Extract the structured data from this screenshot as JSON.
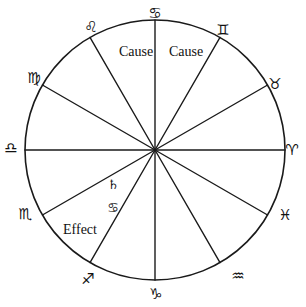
{
  "diagram": {
    "stroke_color": "#1a1a1a",
    "background_color": "#ffffff",
    "center": {
      "x": 155,
      "y": 150
    },
    "radius": 130,
    "spoke_count": 12
  },
  "signs": [
    {
      "name": "cancer",
      "glyph": "♋",
      "label": "Cancer",
      "x": 155,
      "y": 13,
      "angle_deg": 90
    },
    {
      "name": "gemini",
      "glyph": "♊",
      "label": "Gemini",
      "x": 223,
      "y": 30,
      "angle_deg": 60
    },
    {
      "name": "taurus",
      "glyph": "♉",
      "label": "Taurus",
      "x": 275,
      "y": 84,
      "angle_deg": 30
    },
    {
      "name": "aries",
      "glyph": "♈",
      "label": "Aries",
      "x": 292,
      "y": 150,
      "angle_deg": 0
    },
    {
      "name": "pisces",
      "glyph": "♓",
      "label": "Pisces",
      "x": 285,
      "y": 215,
      "angle_deg": -30
    },
    {
      "name": "aquarius",
      "glyph": "♒",
      "label": "Aquarius",
      "x": 238,
      "y": 276,
      "angle_deg": -60
    },
    {
      "name": "capricorn",
      "glyph": "♑",
      "label": "Capricorn",
      "x": 156,
      "y": 294,
      "angle_deg": -90
    },
    {
      "name": "sagittarius",
      "glyph": "♐",
      "label": "Sagittarius",
      "x": 88,
      "y": 279,
      "angle_deg": -120
    },
    {
      "name": "scorpio",
      "glyph": "♏",
      "label": "Scorpio",
      "x": 25,
      "y": 214,
      "angle_deg": -150
    },
    {
      "name": "libra",
      "glyph": "♎",
      "label": "Libra",
      "x": 11,
      "y": 148,
      "angle_deg": 180
    },
    {
      "name": "virgo",
      "glyph": "♍",
      "label": "Virgo",
      "x": 34,
      "y": 78,
      "angle_deg": 150
    },
    {
      "name": "leo",
      "glyph": "♌",
      "label": "Leo",
      "x": 91,
      "y": 27,
      "angle_deg": 120
    }
  ],
  "inner_marks": [
    {
      "name": "saturn",
      "glyph": "♄",
      "label": "Saturn",
      "x": 113,
      "y": 184
    },
    {
      "name": "cancer-inner",
      "glyph": "♋",
      "label": "Cancer",
      "x": 113,
      "y": 207
    }
  ],
  "annotations": [
    {
      "name": "cause-left",
      "text": "Cause",
      "x": 136,
      "y": 52
    },
    {
      "name": "cause-right",
      "text": "Cause",
      "x": 186,
      "y": 52
    },
    {
      "name": "effect",
      "text": "Effect",
      "x": 80,
      "y": 230
    }
  ]
}
